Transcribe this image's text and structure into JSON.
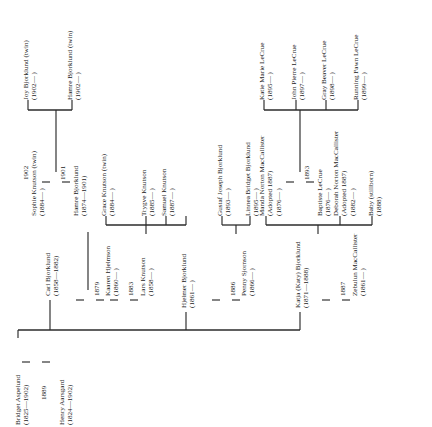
{
  "diagram": {
    "type": "family-tree",
    "orientation": "rotated-90-ccw",
    "line_color": "#2b2b2b",
    "background": "#ffffff"
  },
  "generations": {
    "g1": {
      "label": "founding-couple",
      "people": [
        {
          "id": "bridget-aspelund",
          "name": "Bridget Aspelund",
          "dates": "(1825—1902)"
        },
        {
          "id": "henry-aarsgard",
          "name": "Henry Aarsgard",
          "dates": "(1824—1902)"
        }
      ],
      "marriage_year": "1889"
    },
    "g2": {
      "label": "second-generation",
      "people": [
        {
          "id": "carl-bjorklund",
          "name": "Carl Bjorklund",
          "dates": "(1858—1882)"
        },
        {
          "id": "kaaren-hjelmson",
          "name": "Kaaren Hjelmson",
          "dates": "(1860—  )"
        },
        {
          "id": "lars-knutson",
          "name": "Lars Knutson",
          "dates": "(1858—  )"
        },
        {
          "id": "hjelmer-bjorklund",
          "name": "Hjelmer Bjorklund",
          "dates": "(1861—  )"
        },
        {
          "id": "penny-sjornson",
          "name": "Penny Sjornson",
          "dates": "(1866—  )"
        },
        {
          "id": "katja-bjorklund",
          "name": "Katja (Katy) Bjorklund",
          "dates": "(1871—1888)"
        },
        {
          "id": "zebulun-maccallister",
          "name": "Zebulun MacCallister",
          "dates": "(1861—  )"
        }
      ],
      "marriage_years": [
        "1879",
        "1883",
        "1886",
        "1887"
      ]
    },
    "g3": {
      "label": "third-generation",
      "people": [
        {
          "id": "sophie-knutson",
          "name": "Sophie Knutson (twin)",
          "dates": "(1884—  )"
        },
        {
          "id": "hamre-bjorklund-1874",
          "name": "Hamre Bjorklund",
          "dates": "(1874—1901)"
        },
        {
          "id": "grace-knutson",
          "name": "Grace Knutson (twin)",
          "dates": "(1884—  )"
        },
        {
          "id": "trygve-knutson",
          "name": "Trygve Knutson",
          "dates": "(1885—  )"
        },
        {
          "id": "samuel-knutson",
          "name": "Samuel Knutson",
          "dates": "(1887—  )"
        },
        {
          "id": "gustaf-joseph-bjorklund",
          "name": "Gustaf Joseph Bjorklund",
          "dates": "(1893—  )"
        },
        {
          "id": "linnea-bridget-bjorklund",
          "name": "Linnea Bridget Bjorklund",
          "dates": "(1895—  )"
        },
        {
          "id": "manda-norton-maccallister",
          "name": "Manda Norton MacCallister",
          "adopted": "(Adopted 1887)",
          "dates": "(1876—  )"
        },
        {
          "id": "baptiste-lecrue",
          "name": "Baptiste LeCrue",
          "dates": "(1876—  )"
        },
        {
          "id": "deborah-norton-maccallister",
          "name": "Deborah Norton MacCallister",
          "adopted": "(Adopted 1887)",
          "dates": "(1882—  )"
        },
        {
          "id": "baby-stillborn",
          "name": "Baby (stillborn)",
          "dates": "(1888)"
        }
      ],
      "marriage_years": [
        "1901",
        "1893"
      ]
    },
    "g4": {
      "label": "fourth-generation",
      "people": [
        {
          "id": "joy-bjorklund",
          "name": "Joy Bjorklund (twin)",
          "dates": "(1902—  )"
        },
        {
          "id": "hamre-bjorklund-1902",
          "name": "Hamre Bjorklund (twin)",
          "dates": "(1902—  )"
        },
        {
          "id": "katie-marie-lecrue",
          "name": "Katie Marie LeCrue",
          "dates": "(1895—  )"
        },
        {
          "id": "john-pierre-lecrue",
          "name": "John Pierre LeCrue",
          "dates": "(1897—  )"
        },
        {
          "id": "gray-beaver-lecrue",
          "name": "Gray Beaver LeCrue",
          "dates": "(1898—  )"
        },
        {
          "id": "running-fawn-lecrue",
          "name": "Running Fawn LeCrue",
          "dates": "(1899—  )"
        }
      ],
      "marriage_year": "1902"
    }
  }
}
